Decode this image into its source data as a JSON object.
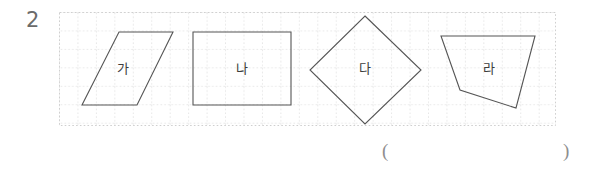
{
  "problem": {
    "number": "2"
  },
  "grid": {
    "cell_size_px": 18.45,
    "line_color": "#cdcdcd",
    "style": "dotted",
    "origin": {
      "x": 59,
      "y": 12
    },
    "size": {
      "width": 497,
      "height": 114
    }
  },
  "figures": [
    {
      "label": "가",
      "shape": "parallelogram",
      "stroke": "#555555",
      "points": "119,32 173,32 137,105 82,105",
      "label_pos": {
        "x": 123,
        "y": 68
      }
    },
    {
      "label": "나",
      "shape": "rectangle",
      "stroke": "#555555",
      "points": "193,32 291,32 291,105 193,105",
      "label_pos": {
        "x": 242,
        "y": 68
      }
    },
    {
      "label": "다",
      "shape": "rhombus",
      "stroke": "#555555",
      "points": "365,16 421,70 365,124 310,70",
      "label_pos": {
        "x": 365,
        "y": 68
      }
    },
    {
      "label": "라",
      "shape": "quadrilateral",
      "stroke": "#555555",
      "points": "441,36 535,36 516,108 460,90",
      "label_pos": {
        "x": 489,
        "y": 68
      }
    }
  ],
  "answer_blank": {
    "open_paren": "(",
    "close_paren": ")",
    "value": ""
  }
}
